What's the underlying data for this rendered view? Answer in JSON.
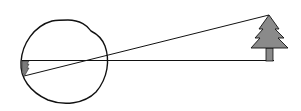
{
  "diagram": {
    "title": "",
    "colors": {
      "stroke": "#111111",
      "tree_fill": "#8a8a8a",
      "retina_image_fill": "#7a7a7a",
      "background": "#ffffff"
    },
    "elements": [
      "eye",
      "tree",
      "horizontal-ray",
      "diagonal-ray",
      "retinal-image"
    ]
  }
}
